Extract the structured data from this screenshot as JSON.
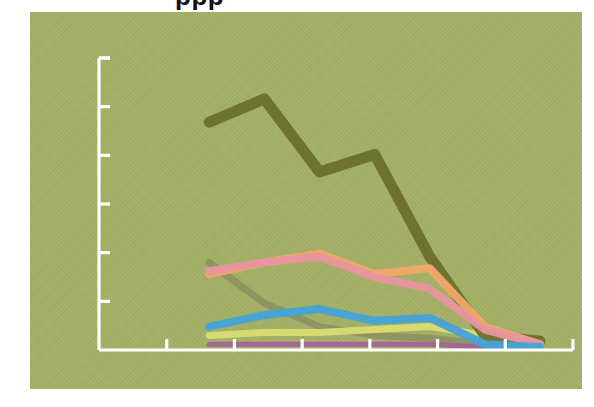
{
  "figure": {
    "background_color": "#ffffff",
    "panel_color": "#a3b065",
    "axis_color": "#ffffff",
    "title_partial": "ppp"
  },
  "chart_data": {
    "type": "line",
    "title": "",
    "subtitle": "",
    "xlabel": "",
    "ylabel": "",
    "grid": false,
    "legend_position": "none",
    "axis_color": "#ffffff",
    "background_color": "#a3b065",
    "x": [
      1,
      2,
      3,
      4,
      5,
      6,
      7,
      8
    ],
    "xlim": [
      0,
      8.6
    ],
    "ylim": [
      0,
      100
    ],
    "x_tick_count": 6,
    "y_tick_count": 6,
    "series": [
      {
        "name": "olive",
        "color": "#6b6f2e",
        "width": 11,
        "values": [
          null,
          78,
          86,
          61,
          67,
          32,
          5,
          3
        ]
      },
      {
        "name": "orange",
        "color": "#f0a868",
        "width": 8,
        "values": [
          null,
          26,
          30,
          33,
          26,
          28,
          8,
          2
        ]
      },
      {
        "name": "pink",
        "color": "#e8959f",
        "width": 8,
        "values": [
          null,
          27,
          30,
          32,
          25,
          21,
          7,
          2
        ]
      },
      {
        "name": "gray-olive",
        "color": "#8a8a62",
        "width": 7,
        "values": [
          null,
          30,
          16,
          8,
          5,
          4,
          2,
          1
        ]
      },
      {
        "name": "blue",
        "color": "#44a3d8",
        "width": 8,
        "values": [
          null,
          8,
          12,
          14,
          10,
          11,
          2,
          1
        ]
      },
      {
        "name": "yellow",
        "color": "#d9dc72",
        "width": 7,
        "values": [
          null,
          5,
          6,
          6,
          7,
          8,
          5,
          2
        ]
      },
      {
        "name": "purple",
        "color": "#a3629a",
        "width": 5,
        "values": [
          null,
          2,
          2,
          2,
          2,
          2,
          1,
          1
        ]
      }
    ]
  },
  "axes": {
    "y_axis": {
      "name": "y-axis",
      "ticks_visible": true
    },
    "x_axis": {
      "name": "x-axis",
      "ticks_visible": true
    }
  }
}
